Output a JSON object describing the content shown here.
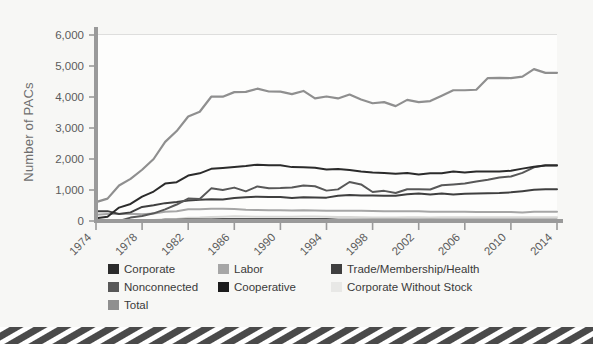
{
  "figure": {
    "background_color": "#f7f7f5",
    "bottom_strip": {
      "name": "decorative-hatched-strip",
      "color_dark": "#4a4a4a",
      "color_light": "#ffffff"
    }
  },
  "chart_data": {
    "type": "line",
    "title": "",
    "subtitle": "",
    "xlabel": "",
    "ylabel": "Number of PACs",
    "xlim": [
      1974,
      2014
    ],
    "ylim": [
      0,
      6000
    ],
    "grid": true,
    "legend_position": "below",
    "y_ticks": [
      0,
      1000,
      2000,
      3000,
      4000,
      5000,
      6000
    ],
    "y_tick_labels": [
      "0",
      "1,000",
      "2,000",
      "3,000",
      "4,000",
      "5,000",
      "6,000"
    ],
    "x_ticks": [
      1974,
      1978,
      1982,
      1986,
      1990,
      1994,
      1998,
      2002,
      2006,
      2010,
      2014
    ],
    "x_tick_labels": [
      "1974",
      "1978",
      "1982",
      "1986",
      "1990",
      "1994",
      "1998",
      "2002",
      "2006",
      "2010",
      "2014"
    ],
    "x": [
      1974,
      1975,
      1976,
      1977,
      1978,
      1979,
      1980,
      1981,
      1982,
      1983,
      1984,
      1985,
      1986,
      1987,
      1988,
      1989,
      1990,
      1991,
      1992,
      1993,
      1994,
      1995,
      1996,
      1997,
      1998,
      1999,
      2000,
      2001,
      2002,
      2003,
      2004,
      2005,
      2006,
      2007,
      2008,
      2009,
      2010,
      2011,
      2012,
      2013,
      2014
    ],
    "series": [
      {
        "name": "Total",
        "color": "#8f8f8f",
        "width": 2.2,
        "values": [
          608,
          722,
          1146,
          1360,
          1653,
          2000,
          2551,
          2901,
          3371,
          3525,
          4009,
          4009,
          4157,
          4165,
          4268,
          4178,
          4172,
          4094,
          4195,
          3954,
          4016,
          3954,
          4079,
          3917,
          3798,
          3835,
          3706,
          3907,
          3835,
          3867,
          4040,
          4217,
          4217,
          4234,
          4611,
          4618,
          4611,
          4657,
          4899,
          4779,
          4779
        ]
      },
      {
        "name": "Corporate",
        "color": "#2b2b2b",
        "width": 2.0,
        "values": [
          89,
          139,
          433,
          550,
          785,
          950,
          1206,
          1251,
          1467,
          1538,
          1682,
          1710,
          1744,
          1775,
          1816,
          1796,
          1795,
          1738,
          1735,
          1715,
          1660,
          1674,
          1642,
          1597,
          1567,
          1548,
          1523,
          1545,
          1497,
          1538,
          1538,
          1600,
          1562,
          1597,
          1598,
          1598,
          1620,
          1690,
          1753,
          1792,
          1792
        ]
      },
      {
        "name": "Trade/Membership/Health",
        "color": "#3f3f3f",
        "width": 2.0,
        "values": [
          318,
          318,
          224,
          278,
          453,
          505,
          576,
          612,
          659,
          688,
          698,
          695,
          745,
          765,
          786,
          777,
          774,
          742,
          770,
          761,
          754,
          815,
          838,
          821,
          825,
          812,
          812,
          861,
          888,
          855,
          887,
          858,
          881,
          890,
          894,
          901,
          924,
          963,
          1010,
          1027,
          1027
        ]
      },
      {
        "name": "Nonconnected",
        "color": "#585858",
        "width": 2.0,
        "values": [
          0,
          0,
          0,
          110,
          162,
          247,
          374,
          531,
          723,
          710,
          1053,
          1003,
          1077,
          957,
          1115,
          1060,
          1062,
          1083,
          1145,
          1121,
          980,
          1020,
          1259,
          1179,
          935,
          972,
          902,
          1026,
          1024,
          1018,
          1154,
          1181,
          1212,
          1271,
          1329,
          1400,
          1437,
          1552,
          1731,
          1797,
          1797
        ]
      },
      {
        "name": "Labor",
        "color": "#a6a6a6",
        "width": 2.0,
        "values": [
          201,
          226,
          224,
          234,
          217,
          240,
          297,
          318,
          380,
          378,
          394,
          392,
          384,
          364,
          354,
          349,
          346,
          338,
          347,
          337,
          333,
          334,
          332,
          332,
          321,
          318,
          316,
          317,
          311,
          302,
          299,
          297,
          295,
          291,
          288,
          287,
          287,
          275,
          298,
          301,
          301
        ]
      },
      {
        "name": "Cooperative",
        "color": "#1c1c1c",
        "width": 2.0,
        "values": [
          0,
          0,
          0,
          8,
          12,
          17,
          42,
          41,
          47,
          51,
          52,
          54,
          56,
          59,
          59,
          59,
          59,
          57,
          56,
          57,
          53,
          44,
          41,
          42,
          39,
          41,
          40,
          38,
          38,
          39,
          38,
          39,
          39,
          40,
          39,
          38,
          38,
          38,
          38,
          38,
          38
        ]
      },
      {
        "name": "Corporate Without Stock",
        "color": "#d8d8d6",
        "width": 2.0,
        "values": [
          0,
          0,
          0,
          20,
          24,
          32,
          56,
          68,
          103,
          110,
          130,
          138,
          151,
          145,
          138,
          137,
          136,
          136,
          142,
          146,
          136,
          129,
          127,
          123,
          115,
          114,
          114,
          120,
          117,
          116,
          123,
          122,
          119,
          120,
          119,
          118,
          118,
          118,
          118,
          118,
          118
        ]
      }
    ]
  },
  "legend": {
    "items": [
      {
        "label": "Corporate",
        "color": "#2b2b2b"
      },
      {
        "label": "Labor",
        "color": "#a6a6a6"
      },
      {
        "label": "Trade/Membership/Health",
        "color": "#3f3f3f"
      },
      {
        "label": "Nonconnected",
        "color": "#585858"
      },
      {
        "label": "Cooperative",
        "color": "#1c1c1c"
      },
      {
        "label": "Corporate Without Stock",
        "color": "#e8e8e6"
      },
      {
        "label": "Total",
        "color": "#8f8f8f"
      }
    ]
  }
}
